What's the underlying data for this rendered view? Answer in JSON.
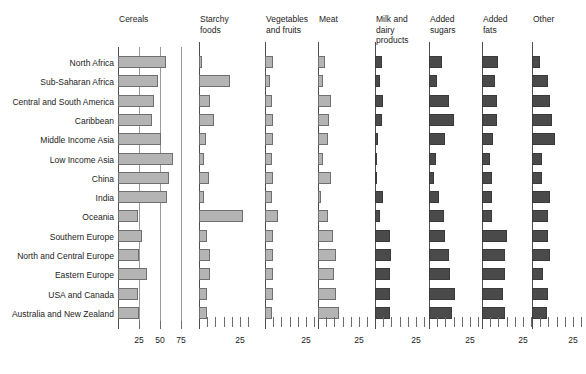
{
  "chart_data": {
    "type": "bar",
    "title": "",
    "subtitle": "",
    "xlabel": "",
    "ylabel": "",
    "orientation": "horizontal",
    "grid": "vertical gridlines in first panel only",
    "legend": "none",
    "panel_layout": "small multiples, 8 panels sharing one categorical y-axis",
    "categories": [
      "North Africa",
      "Sub-Saharan Africa",
      "Central and South America",
      "Caribbean",
      "Middle Income Asia",
      "Low Income Asia",
      "China",
      "India",
      "Oceania",
      "Southern Europe",
      "North and Central Europe",
      "Eastern Europe",
      "USA and Canada",
      "Australia and New Zealand"
    ],
    "panels": [
      {
        "name": "Cereals",
        "title": "Cereals",
        "fill": "light",
        "xlim": [
          0,
          82
        ],
        "ticks": [
          25,
          50,
          75
        ],
        "tick_labels": [
          "25",
          "50",
          "75"
        ],
        "minor_ticks": false,
        "gridlines": [
          25,
          50,
          75
        ],
        "values": [
          57,
          48,
          43,
          40,
          51,
          66,
          61,
          58,
          24,
          28,
          25,
          34,
          24,
          25
        ]
      },
      {
        "name": "Starchy foods",
        "title": "Starchy\nfoods",
        "fill": "light",
        "xlim": [
          0,
          40
        ],
        "ticks": [
          25
        ],
        "tick_labels": [
          "25"
        ],
        "minor_ticks": true,
        "gridlines": [],
        "values": [
          2,
          19,
          7,
          9,
          4,
          3,
          6,
          3,
          27,
          5,
          7,
          7,
          5,
          5
        ]
      },
      {
        "name": "Vegetables and fruits",
        "title": "Vegetables\nand fruits",
        "fill": "light",
        "xlim": [
          0,
          40
        ],
        "ticks": [
          25
        ],
        "tick_labels": [
          "25"
        ],
        "minor_ticks": true,
        "gridlines": [],
        "values": [
          5,
          3,
          4,
          5,
          5,
          4,
          5,
          4,
          8,
          5,
          5,
          5,
          5,
          4
        ]
      },
      {
        "name": "Meat",
        "title": "Meat",
        "fill": "light",
        "xlim": [
          0,
          40
        ],
        "ticks": [
          25
        ],
        "tick_labels": [
          "25"
        ],
        "minor_ticks": true,
        "gridlines": [],
        "values": [
          4,
          3,
          8,
          7,
          6,
          3,
          8,
          2,
          6,
          9,
          11,
          10,
          11,
          13
        ]
      },
      {
        "name": "Milk and dairy products",
        "title": "Milk and\ndairy\nproducts",
        "fill": "dark",
        "xlim": [
          0,
          40
        ],
        "ticks": [
          25
        ],
        "tick_labels": [
          "25"
        ],
        "minor_ticks": true,
        "gridlines": [],
        "values": [
          4,
          3,
          5,
          4,
          2,
          1,
          1,
          5,
          3,
          9,
          10,
          9,
          9,
          9
        ]
      },
      {
        "name": "Added sugars",
        "title": "Added\nsugars",
        "fill": "dark",
        "xlim": [
          0,
          40
        ],
        "ticks": [
          25
        ],
        "tick_labels": [
          "25"
        ],
        "minor_ticks": true,
        "gridlines": [],
        "values": [
          8,
          5,
          12,
          15,
          10,
          4,
          3,
          6,
          9,
          10,
          12,
          13,
          16,
          14
        ]
      },
      {
        "name": "Added fats",
        "title": "Added\nfats",
        "fill": "dark",
        "xlim": [
          0,
          40
        ],
        "ticks": [
          25
        ],
        "tick_labels": [
          "25"
        ],
        "minor_ticks": true,
        "gridlines": [],
        "values": [
          10,
          8,
          9,
          9,
          7,
          5,
          6,
          6,
          6,
          15,
          14,
          14,
          13,
          14
        ]
      },
      {
        "name": "Other",
        "title": "Other",
        "fill": "dark",
        "xlim": [
          0,
          40
        ],
        "ticks": [
          25
        ],
        "tick_labels": [
          "25"
        ],
        "minor_ticks": true,
        "gridlines": [],
        "values": [
          5,
          10,
          11,
          12,
          14,
          6,
          6,
          11,
          10,
          10,
          11,
          7,
          10,
          9
        ]
      }
    ]
  },
  "colors": {
    "light_bar_fill": "#b4b4b4",
    "light_bar_stroke": "#6f6f6f",
    "dark_bar_fill": "#4a4a4a",
    "dark_bar_stroke": "#3a3a3a",
    "axis": "#4d4d4d",
    "gridline": "#9a9a9a",
    "background": "#ffffff",
    "text": "#1c1c1c"
  }
}
